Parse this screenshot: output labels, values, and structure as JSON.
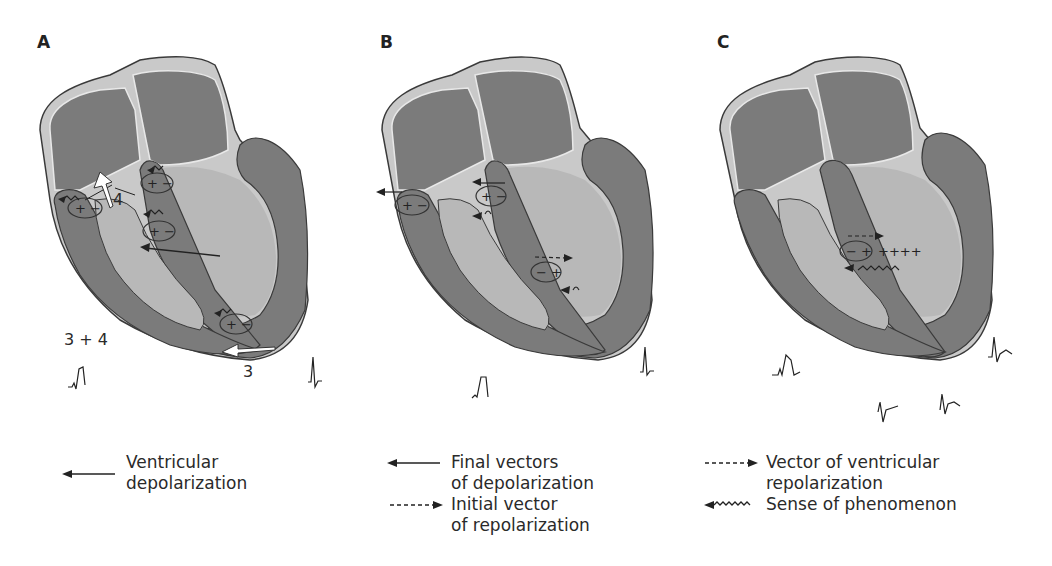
{
  "figure": {
    "panels": [
      {
        "id": "A",
        "label": "A",
        "annotations": {
          "num_4": "4",
          "num_3": "3",
          "sum": "3 + 4"
        },
        "dipoles": [
          "+ −",
          "+ −",
          "+ −",
          "+ −"
        ]
      },
      {
        "id": "B",
        "label": "B",
        "dipoles": [
          "+ −",
          "+ −",
          "− +"
        ]
      },
      {
        "id": "C",
        "label": "C",
        "dipoles": [
          "− +"
        ],
        "charges": "++++"
      }
    ],
    "legend": {
      "A": [
        {
          "symbol": "solid-arrow-left",
          "lines": [
            "Ventricular",
            "depolarization"
          ]
        }
      ],
      "B": [
        {
          "symbol": "solid-arrow-left",
          "lines": [
            "Final vectors",
            "of depolarization"
          ]
        },
        {
          "symbol": "dashed-arrow-right",
          "lines": [
            "Initial vector",
            "of repolarization"
          ]
        }
      ],
      "C": [
        {
          "symbol": "dashed-arrow-right",
          "lines": [
            "Vector of ventricular",
            "repolarization"
          ]
        },
        {
          "symbol": "wavy-arrow-left",
          "lines": [
            "Sense of phenomenon"
          ]
        }
      ]
    },
    "colors": {
      "myocardium_dark": "#7b7b7b",
      "cavity_light": "#b8b8b8",
      "outline": "#3a3a3a",
      "septum_light": "#c9c9c9",
      "arrow_white": "#ffffff"
    }
  }
}
